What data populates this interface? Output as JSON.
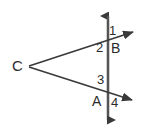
{
  "figure": {
    "background_color": "#ffffff",
    "stroke_color": "#3a3a3a",
    "label_color": "#2b2b2b",
    "points": {
      "C": {
        "label": "C",
        "x": 28,
        "y": 66
      },
      "B": {
        "label": "B",
        "x": 108,
        "y": 40
      },
      "A": {
        "label": "A",
        "x": 108,
        "y": 95
      }
    },
    "angles": [
      {
        "label": "1",
        "x": 110,
        "y": 26,
        "at": "B",
        "position": "upper-right"
      },
      {
        "label": "2",
        "x": 97,
        "y": 43,
        "at": "B",
        "position": "lower-left"
      },
      {
        "label": "3",
        "x": 98,
        "y": 75,
        "at": "A",
        "position": "upper-left"
      },
      {
        "label": "4",
        "x": 112,
        "y": 98,
        "at": "A",
        "position": "lower-right"
      }
    ],
    "lines": {
      "transversal": {
        "name": "vertical-double-arrow-line",
        "x": 108,
        "y_top": 12,
        "y_bottom": 124,
        "arrow_top": true,
        "arrow_bottom": true
      },
      "ray_upper": {
        "name": "ray-C-through-B",
        "from_x": 28,
        "from_y": 66,
        "to_x": 139,
        "to_y": 30,
        "arrow_end": true
      },
      "ray_lower": {
        "name": "ray-C-through-A",
        "from_x": 28,
        "from_y": 66,
        "to_x": 141,
        "to_y": 104,
        "arrow_end": true
      }
    }
  }
}
